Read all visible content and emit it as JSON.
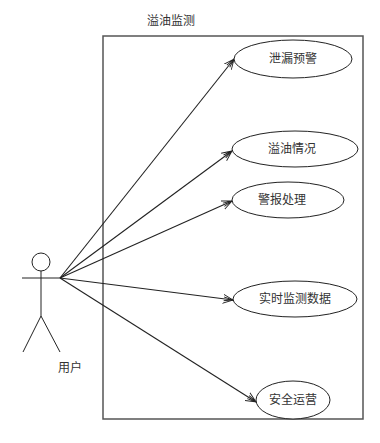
{
  "diagram": {
    "type": "uml-use-case",
    "system_boundary": {
      "title": "溢油监测",
      "x": 103,
      "y": 36,
      "width": 260,
      "height": 383
    },
    "actor": {
      "label": "用户",
      "head": {
        "cx": 41,
        "cy": 262,
        "r": 9
      },
      "connection_point": {
        "x": 60,
        "y": 278
      }
    },
    "use_cases": [
      {
        "id": "uc1",
        "label": "泄漏预警",
        "cx": 293,
        "cy": 59,
        "rx": 59,
        "ry": 19,
        "arrow_end": {
          "x": 234,
          "y": 59
        }
      },
      {
        "id": "uc2",
        "label": "溢油情况",
        "cx": 295,
        "cy": 149,
        "rx": 63,
        "ry": 18,
        "arrow_end": {
          "x": 232,
          "y": 151
        }
      },
      {
        "id": "uc3",
        "label": "警报处理",
        "cx": 288,
        "cy": 200,
        "rx": 56,
        "ry": 18,
        "arrow_end": {
          "x": 232,
          "y": 201
        }
      },
      {
        "id": "uc4",
        "label": "实时监测数据",
        "cx": 295,
        "cy": 299,
        "rx": 62,
        "ry": 18,
        "arrow_end": {
          "x": 233,
          "y": 300
        }
      },
      {
        "id": "uc5",
        "label": "安全运营",
        "cx": 293,
        "cy": 400,
        "rx": 37,
        "ry": 19,
        "arrow_end": {
          "x": 256,
          "y": 402
        }
      }
    ],
    "colors": {
      "stroke": "#222222",
      "boundary": "#555555",
      "text": "#333333",
      "background": "#ffffff"
    }
  }
}
